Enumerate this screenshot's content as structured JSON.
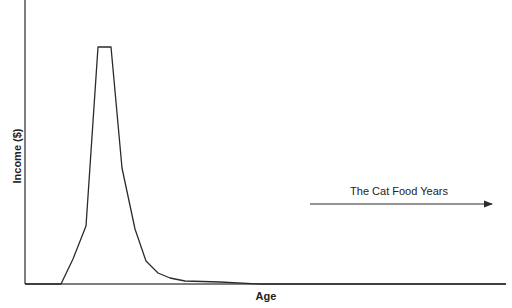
{
  "chart_data": {
    "type": "line",
    "title": "",
    "xlabel": "Age",
    "ylabel": "Income ($)",
    "x_ticks": [],
    "y_ticks": [],
    "grid": false,
    "legend": null,
    "series": [
      {
        "name": "Income",
        "points_px": [
          [
            25,
            284
          ],
          [
            61,
            284
          ],
          [
            73,
            259
          ],
          [
            86,
            226
          ],
          [
            98,
            47
          ],
          [
            111,
            47
          ],
          [
            122,
            168
          ],
          [
            135,
            229
          ],
          [
            146,
            261
          ],
          [
            158,
            273
          ],
          [
            170,
            278
          ],
          [
            185,
            281
          ],
          [
            220,
            282
          ],
          [
            260,
            284
          ],
          [
            506,
            284
          ]
        ]
      }
    ],
    "annotations": [
      {
        "text": "The Cat Food Years",
        "arrow": {
          "from": [
            310,
            204
          ],
          "to": [
            492,
            204
          ],
          "direction": "right"
        }
      }
    ]
  },
  "axes": {
    "y_label": "Income ($)",
    "x_label": "Age"
  },
  "annotation": {
    "text": "The Cat Food Years"
  },
  "colors": {
    "line": "#2b2b2b",
    "axis": "#555555",
    "background": "#ffffff"
  }
}
